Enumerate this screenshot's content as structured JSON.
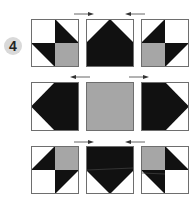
{
  "step": {
    "number": "4"
  },
  "colors": {
    "dark": "#111111",
    "gray": "#a6a6a6",
    "light": "#ffffff",
    "border": "#6e6e6e"
  },
  "blocks": [
    {
      "row": 0,
      "col": 0,
      "type": "four-patch-hst",
      "description": "white TL, black triangle TR, black triangle BL, gray BR"
    },
    {
      "row": 0,
      "col": 1,
      "type": "flying-geese-up",
      "description": "black point up"
    },
    {
      "row": 0,
      "col": 2,
      "type": "four-patch-hst-mirror",
      "description": "black triangle TL, white TR, gray BL, black triangle BR"
    },
    {
      "row": 1,
      "col": 0,
      "type": "flying-geese-left",
      "description": "black point left"
    },
    {
      "row": 1,
      "col": 1,
      "type": "solid-square",
      "description": "gray center"
    },
    {
      "row": 1,
      "col": 2,
      "type": "flying-geese-right",
      "description": "black point right"
    },
    {
      "row": 2,
      "col": 0,
      "type": "four-patch-hst",
      "description": "black triangle TL, gray TR, white BL, black triangle BR"
    },
    {
      "row": 2,
      "col": 1,
      "type": "flying-geese-down",
      "description": "black point down"
    },
    {
      "row": 2,
      "col": 2,
      "type": "four-patch-hst-mirror",
      "description": "gray TL, black triangle TR, black triangle BL, white BR"
    }
  ],
  "arrows": [
    {
      "position": "above-row-1",
      "x": 74,
      "direction": "right"
    },
    {
      "position": "above-row-1",
      "x": 126,
      "direction": "left"
    },
    {
      "position": "above-row-2",
      "x": 70,
      "direction": "left"
    },
    {
      "position": "above-row-2",
      "x": 129,
      "direction": "right"
    },
    {
      "position": "above-row-3",
      "x": 74,
      "direction": "right"
    },
    {
      "position": "above-row-3",
      "x": 126,
      "direction": "left"
    }
  ]
}
